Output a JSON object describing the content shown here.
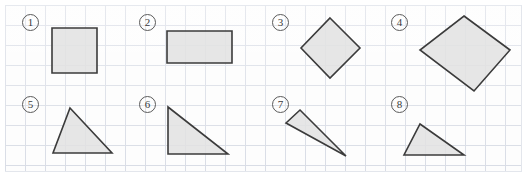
{
  "worksheet": {
    "title": "Geometric Shapes on Grid Paper",
    "width": 527,
    "height": 179,
    "grid": {
      "cell_size": 20,
      "line_color": "#d9dde6",
      "background_color": "#fdfdfd",
      "origin_x": 5,
      "origin_y": 5,
      "panel_width": 517,
      "panel_height": 167
    },
    "style": {
      "shape_fill": "#e2e2e2",
      "shape_stroke": "#3b3b3b",
      "label_stroke": "#5a5a5a",
      "label_text_color": "#3a3a3a"
    }
  },
  "shapes": [
    {
      "id": 1,
      "label": "1",
      "kind": "square",
      "label_position": {
        "x": 22,
        "y": 14
      },
      "points": "52,28 97,28 97,73 52,73",
      "vertices": [
        [
          52,
          28
        ],
        [
          97,
          28
        ],
        [
          97,
          73
        ],
        [
          52,
          73
        ]
      ],
      "description": "axis-aligned square"
    },
    {
      "id": 2,
      "label": "2",
      "kind": "rectangle",
      "label_position": {
        "x": 139,
        "y": 14
      },
      "points": "167,31 232,31 232,63 167,63",
      "vertices": [
        [
          167,
          31
        ],
        [
          232,
          31
        ],
        [
          232,
          63
        ],
        [
          167,
          63
        ]
      ],
      "description": "axis-aligned wide rectangle"
    },
    {
      "id": 3,
      "label": "3",
      "kind": "square-rotated",
      "label_position": {
        "x": 272,
        "y": 14
      },
      "points": "330,18 360,48 330,78 301,48",
      "vertices": [
        [
          330,
          18
        ],
        [
          360,
          48
        ],
        [
          330,
          78
        ],
        [
          301,
          48
        ]
      ],
      "description": "square rotated 45 degrees (diamond)"
    },
    {
      "id": 4,
      "label": "4",
      "kind": "quadrilateral-tilted",
      "label_position": {
        "x": 391,
        "y": 14
      },
      "points": "464,16 510,50 474,91 420,50",
      "vertices": [
        [
          464,
          16
        ],
        [
          510,
          50
        ],
        [
          474,
          91
        ],
        [
          420,
          50
        ]
      ],
      "description": "tilted quadrilateral"
    },
    {
      "id": 5,
      "label": "5",
      "kind": "triangle",
      "label_position": {
        "x": 22,
        "y": 96
      },
      "points": "70,108 112,153 53,153",
      "vertices": [
        [
          70,
          108
        ],
        [
          112,
          153
        ],
        [
          53,
          153
        ]
      ],
      "description": "acute triangle"
    },
    {
      "id": 6,
      "label": "6",
      "kind": "triangle-right",
      "label_position": {
        "x": 139,
        "y": 96
      },
      "points": "168,107 228,154 168,154",
      "vertices": [
        [
          168,
          107
        ],
        [
          228,
          154
        ],
        [
          168,
          154
        ]
      ],
      "description": "right triangle with vertical left leg"
    },
    {
      "id": 7,
      "label": "7",
      "kind": "triangle-sliver",
      "label_position": {
        "x": 272,
        "y": 96
      },
      "points": "300,110 346,156 286,123",
      "vertices": [
        [
          300,
          110
        ],
        [
          346,
          156
        ],
        [
          286,
          123
        ]
      ],
      "description": "thin sliver triangle pointing down-right"
    },
    {
      "id": 8,
      "label": "8",
      "kind": "triangle-obtuse",
      "label_position": {
        "x": 391,
        "y": 96
      },
      "points": "420,124 464,155 404,155",
      "vertices": [
        [
          420,
          124
        ],
        [
          464,
          155
        ],
        [
          404,
          155
        ]
      ],
      "description": "obtuse/scalene triangle"
    }
  ]
}
